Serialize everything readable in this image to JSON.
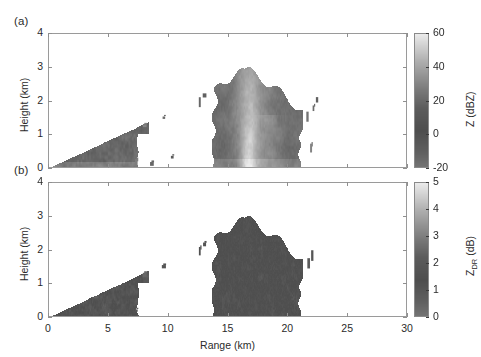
{
  "figure": {
    "width": 481,
    "height": 357,
    "background": "#ffffff"
  },
  "panels": [
    {
      "letter": "(a)",
      "ylabel": "Height (km)",
      "xlabel": "",
      "yticks": [
        "0",
        "1",
        "2",
        "3",
        "4"
      ],
      "ytick_values": [
        0,
        1,
        2,
        3,
        4
      ],
      "xticks": [
        "0",
        "5",
        "10",
        "15",
        "20",
        "25",
        "30"
      ],
      "xtick_values": [
        0,
        5,
        10,
        15,
        20,
        25,
        30
      ],
      "xtick_labels_visible": false,
      "colorbar": {
        "label": "Z (dBZ)",
        "label_main": "Z",
        "label_sub": "",
        "label_unit": "(dBZ)",
        "ticks": [
          "-20",
          "0",
          "20",
          "40",
          "60"
        ],
        "tick_values": [
          -20,
          0,
          20,
          40,
          60
        ],
        "vmin": -20,
        "vmax": 60
      }
    },
    {
      "letter": "(b)",
      "ylabel": "Height (km)",
      "xlabel": "Range (km)",
      "yticks": [
        "0",
        "1",
        "2",
        "3",
        "4"
      ],
      "ytick_values": [
        0,
        1,
        2,
        3,
        4
      ],
      "xticks": [
        "0",
        "5",
        "10",
        "15",
        "20",
        "25",
        "30"
      ],
      "xtick_values": [
        0,
        5,
        10,
        15,
        20,
        25,
        30
      ],
      "xtick_labels_visible": true,
      "colorbar": {
        "label": "Z_DR (dB)",
        "label_main": "Z",
        "label_sub": "DR",
        "label_unit": "(dB)",
        "ticks": [
          "0",
          "1",
          "2",
          "3",
          "4",
          "5"
        ],
        "tick_values": [
          0,
          1,
          2,
          3,
          4,
          5
        ],
        "vmin": 0,
        "vmax": 5
      }
    }
  ],
  "chart_data": {
    "type": "heatmap",
    "title": "",
    "xlabel": "Range (km)",
    "ylabel": "Height (km)",
    "xlim": [
      0,
      30
    ],
    "ylim": [
      0,
      4
    ],
    "grid": false,
    "colormap": "grayscale-rendered",
    "panels": [
      {
        "name": "(a)",
        "quantity": "Z",
        "units": "dBZ",
        "clim": [
          -20,
          60
        ],
        "colorbar_ticks": [
          -20,
          0,
          20,
          40,
          60
        ],
        "features": [
          {
            "kind": "ground-clutter-wedge",
            "description": "near-range beam-filled wedge from origin widening with range",
            "x_range": [
              0.0,
              8.3
            ],
            "y_range": [
              0.0,
              1.35
            ],
            "apex": [
              0.0,
              0.0
            ],
            "top_slope_km_per_km": 0.165,
            "typical_value_dbz": 18,
            "peak_value_dbz": 42
          },
          {
            "kind": "main-convective-cell",
            "description": "deep echo with bright convective core and anvil-like top edge",
            "x_range": [
              13.6,
              21.2
            ],
            "y_range": [
              0.0,
              2.95
            ],
            "top_left_height": 2.35,
            "top_peak_height": 2.95,
            "top_peak_x": 16.3,
            "typical_value_dbz": 25,
            "core_value_dbz": 55,
            "core_x_range": [
              16.2,
              17.4
            ],
            "core_y_range": [
              0.0,
              2.5
            ]
          },
          {
            "kind": "detached-fragments",
            "description": "small isolated echo specks between wedge and main cell",
            "points": [
              {
                "x": 8.0,
                "y": 1.28,
                "value_dbz": 30
              },
              {
                "x": 9.6,
                "y": 1.52,
                "value_dbz": 22
              },
              {
                "x": 12.6,
                "y": 1.98,
                "value_dbz": 20
              },
              {
                "x": 13.0,
                "y": 2.18,
                "value_dbz": 18
              },
              {
                "x": 10.3,
                "y": 0.35,
                "value_dbz": 15
              },
              {
                "x": 7.3,
                "y": 0.18,
                "value_dbz": 28
              },
              {
                "x": 8.6,
                "y": 0.15,
                "value_dbz": 20
              }
            ]
          },
          {
            "kind": "far-edge-streaks",
            "description": "narrow vertical echo streaks on the downrange flank of the cell",
            "points": [
              {
                "x": 21.6,
                "y": 1.55,
                "value_dbz": 25
              },
              {
                "x": 22.1,
                "y": 1.8,
                "value_dbz": 22
              },
              {
                "x": 21.9,
                "y": 0.62,
                "value_dbz": 30
              },
              {
                "x": 22.4,
                "y": 2.05,
                "value_dbz": 18
              }
            ]
          }
        ]
      },
      {
        "name": "(b)",
        "quantity": "Z_DR",
        "units": "dB",
        "clim": [
          0,
          5
        ],
        "colorbar_ticks": [
          0,
          1,
          2,
          3,
          4,
          5
        ],
        "features": [
          {
            "kind": "ground-clutter-wedge",
            "description": "same near-range wedge, noisy speckled differential reflectivity",
            "x_range": [
              0.0,
              8.3
            ],
            "y_range": [
              0.0,
              1.35
            ],
            "apex": [
              0.0,
              0.0
            ],
            "top_slope_km_per_km": 0.165,
            "typical_value_db": 1.6,
            "peak_value_db": 4.5
          },
          {
            "kind": "main-convective-cell",
            "description": "same cell footprint, strongly mottled texture with high-ZDR filaments",
            "x_range": [
              13.6,
              21.2
            ],
            "y_range": [
              0.0,
              2.95
            ],
            "top_left_height": 2.35,
            "top_peak_height": 2.95,
            "top_peak_x": 16.3,
            "typical_value_db": 1.4,
            "filament_value_db": 4.2
          },
          {
            "kind": "detached-fragments",
            "points": [
              {
                "x": 8.0,
                "y": 1.28,
                "value_db": 2.5
              },
              {
                "x": 9.6,
                "y": 1.52,
                "value_db": 1.8
              },
              {
                "x": 12.6,
                "y": 1.98,
                "value_db": 1.5
              },
              {
                "x": 13.0,
                "y": 2.18,
                "value_db": 1.2
              },
              {
                "x": 7.3,
                "y": 0.22,
                "value_db": 2.0
              }
            ]
          },
          {
            "kind": "far-edge-streaks",
            "points": [
              {
                "x": 21.7,
                "y": 1.62,
                "value_db": 2.2
              },
              {
                "x": 22.0,
                "y": 1.85,
                "value_db": 1.9
              }
            ]
          }
        ]
      }
    ]
  },
  "layout": {
    "axes_a": {
      "left": 48,
      "top": 33,
      "width": 359,
      "height": 135
    },
    "axes_b": {
      "left": 48,
      "top": 182,
      "width": 359,
      "height": 135
    },
    "cbar_a": {
      "left": 414,
      "top": 33,
      "width": 15,
      "height": 135
    },
    "cbar_b": {
      "left": 414,
      "top": 182,
      "width": 15,
      "height": 135
    }
  }
}
